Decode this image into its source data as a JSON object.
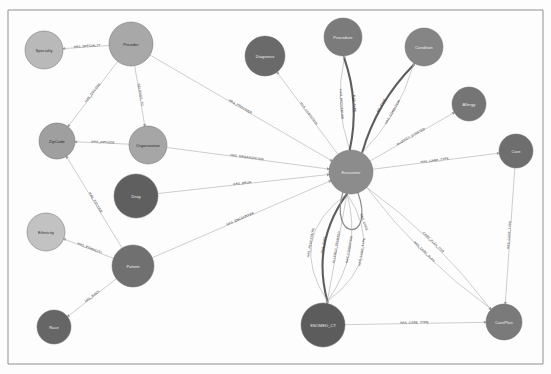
{
  "diagram": {
    "type": "force-directed-node-link-graph",
    "background_color": "#fdfdfd",
    "frame_color": "#8f8f8f"
  },
  "nodes": [
    {
      "id": "specialty",
      "label": "Specialty",
      "x": 44,
      "y": 50,
      "r": 19,
      "color": "#b9b9b9",
      "text_color": "dark"
    },
    {
      "id": "provider",
      "label": "Provider",
      "x": 131,
      "y": 44,
      "r": 22,
      "color": "#a8a8a8",
      "text_color": "dark"
    },
    {
      "id": "zipcode",
      "label": "ZipCode",
      "x": 57,
      "y": 141,
      "r": 18,
      "color": "#9f9f9f",
      "text_color": "dark"
    },
    {
      "id": "organization",
      "label": "Organization",
      "x": 148,
      "y": 145,
      "r": 19,
      "color": "#a6a6a6",
      "text_color": "dark"
    },
    {
      "id": "drug",
      "label": "Drug",
      "x": 136,
      "y": 196,
      "r": 22,
      "color": "#5f5f5f",
      "text_color": "light"
    },
    {
      "id": "ethnicity",
      "label": "Ethnicity",
      "x": 46,
      "y": 232,
      "r": 19,
      "color": "#c2c2c2",
      "text_color": "dark"
    },
    {
      "id": "patient",
      "label": "Patient",
      "x": 133,
      "y": 266,
      "r": 21,
      "color": "#707070",
      "text_color": "light"
    },
    {
      "id": "race",
      "label": "Race",
      "x": 54,
      "y": 327,
      "r": 17,
      "color": "#666666",
      "text_color": "light"
    },
    {
      "id": "diagnosis",
      "label": "Diagnosis",
      "x": 265,
      "y": 56,
      "r": 20,
      "color": "#6a6a6a",
      "text_color": "light"
    },
    {
      "id": "procedure",
      "label": "Procedure",
      "x": 343,
      "y": 37,
      "r": 19,
      "color": "#7b7b7b",
      "text_color": "light"
    },
    {
      "id": "condition",
      "label": "Condition",
      "x": 424,
      "y": 47,
      "r": 19,
      "color": "#858585",
      "text_color": "light"
    },
    {
      "id": "allergy",
      "label": "Allergy",
      "x": 469,
      "y": 104,
      "r": 17,
      "color": "#757575",
      "text_color": "light"
    },
    {
      "id": "encounter",
      "label": "Encounter",
      "x": 351,
      "y": 172,
      "r": 22,
      "color": "#8c8c8c",
      "text_color": "light"
    },
    {
      "id": "care",
      "label": "Care",
      "x": 516,
      "y": 151,
      "r": 17,
      "color": "#6e6e6e",
      "text_color": "light"
    },
    {
      "id": "snomed_ct",
      "label": "SNOMED_CT",
      "x": 323,
      "y": 325,
      "r": 22,
      "color": "#5c5c5c",
      "text_color": "light"
    },
    {
      "id": "careplan",
      "label": "CarePlan",
      "x": 504,
      "y": 322,
      "r": 18,
      "color": "#7a7a7a",
      "text_color": "light"
    }
  ],
  "edges": [
    {
      "id": "e1",
      "source": "provider",
      "target": "specialty",
      "label": "HAS_SPECIALTY",
      "weight": "thin"
    },
    {
      "id": "e2",
      "source": "provider",
      "target": "zipcode",
      "label": "HAS_ZIPCODE",
      "weight": "thin"
    },
    {
      "id": "e3",
      "source": "provider",
      "target": "organization",
      "label": "BELONGS_TO",
      "weight": "thin"
    },
    {
      "id": "e4",
      "source": "provider",
      "target": "encounter",
      "label": "HAS_PROVIDER",
      "weight": "thin"
    },
    {
      "id": "e5",
      "source": "organization",
      "target": "zipcode",
      "label": "HAS_ZIPCODE",
      "weight": "thin"
    },
    {
      "id": "e6",
      "source": "organization",
      "target": "encounter",
      "label": "HAS_ORGANIZATION",
      "weight": "thin"
    },
    {
      "id": "e7",
      "source": "drug",
      "target": "encounter",
      "label": "HAS_DRUG",
      "weight": "thin"
    },
    {
      "id": "e8",
      "source": "patient",
      "target": "zipcode",
      "label": "HAS_ZIPCODE",
      "weight": "thin"
    },
    {
      "id": "e9",
      "source": "patient",
      "target": "ethnicity",
      "label": "HAS_ETHNICITY",
      "weight": "thin"
    },
    {
      "id": "e10",
      "source": "patient",
      "target": "race",
      "label": "HAS_RACE",
      "weight": "thin"
    },
    {
      "id": "e11",
      "source": "patient",
      "target": "encounter",
      "label": "HAS_ENCOUNTER",
      "weight": "thin"
    },
    {
      "id": "e12",
      "source": "encounter",
      "target": "diagnosis",
      "label": "HAS_CONDITION",
      "weight": "thin"
    },
    {
      "id": "e13",
      "source": "encounter",
      "target": "procedure",
      "label": "HAS_PROCEDURE",
      "weight": "thin"
    },
    {
      "id": "e14",
      "source": "encounter",
      "target": "procedure",
      "label": "HAS_TYPE",
      "weight": "thick"
    },
    {
      "id": "e15",
      "source": "encounter",
      "target": "condition",
      "label": "OF_TYPE",
      "weight": "thick"
    },
    {
      "id": "e16",
      "source": "encounter",
      "target": "condition",
      "label": "HAS_CONDITION",
      "weight": "thin"
    },
    {
      "id": "e17",
      "source": "encounter",
      "target": "allergy",
      "label": "ALLERGY_STARTED",
      "weight": "thin"
    },
    {
      "id": "e18",
      "source": "encounter",
      "target": "care",
      "label": "HAS_CARE_TYPE",
      "weight": "thin"
    },
    {
      "id": "e19",
      "source": "encounter",
      "target": "snomed_ct",
      "label": "HAS_CARE_TYPE",
      "weight": "thin"
    },
    {
      "id": "e20",
      "source": "encounter",
      "target": "snomed_ct",
      "label": "HAS_CONDITION",
      "weight": "thin"
    },
    {
      "id": "e21",
      "source": "encounter",
      "target": "snomed_ct",
      "label": "ALLERGY_STARTED",
      "weight": "thin"
    },
    {
      "id": "e22",
      "source": "encounter",
      "target": "snomed_ct",
      "label": "HAS_TYPE",
      "weight": "thick"
    },
    {
      "id": "e23",
      "source": "encounter",
      "target": "encounter",
      "label": "HAS_CODE",
      "weight": "medium"
    },
    {
      "id": "e24",
      "source": "encounter",
      "target": "snomed_ct",
      "label": "HAS_PROCEDURE",
      "weight": "thin"
    },
    {
      "id": "e25",
      "source": "encounter",
      "target": "careplan",
      "label": "CARE_PLAN_FOR",
      "weight": "thin"
    },
    {
      "id": "e26",
      "source": "encounter",
      "target": "careplan",
      "label": "HAS_CARE_PLAN",
      "weight": "thin"
    },
    {
      "id": "e27",
      "source": "care",
      "target": "careplan",
      "label": "HAS_CARE_TYPE",
      "weight": "thin"
    },
    {
      "id": "e28",
      "source": "snomed_ct",
      "target": "careplan",
      "label": "HAS_CARE_TYPE",
      "weight": "thin"
    }
  ]
}
